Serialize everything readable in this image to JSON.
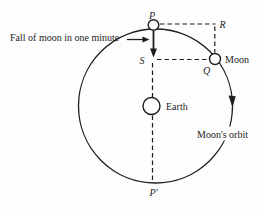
{
  "figure": {
    "colors": {
      "background": "#fdfdfd",
      "ink": "#1d1d1d"
    },
    "annotation": {
      "fall_label": "Fall of moon in one minute"
    },
    "labels": {
      "p": "P",
      "r": "R",
      "s": "S",
      "q": "Q",
      "p_prime": "P′",
      "earth": "Earth",
      "moon": "Moon",
      "orbit": "Moon's orbit"
    }
  }
}
